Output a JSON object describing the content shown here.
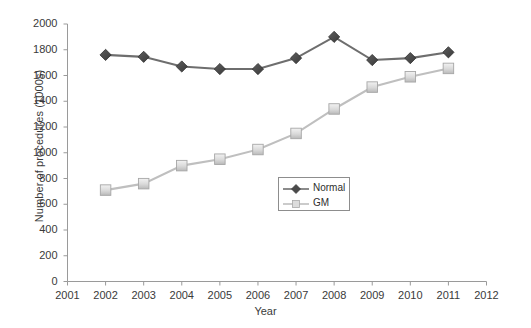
{
  "chart_data": {
    "type": "line",
    "title": "",
    "xlabel": "Year",
    "ylabel": "Number of procedures (1000s)",
    "xlim": [
      2001,
      2012
    ],
    "ylim": [
      0,
      2000
    ],
    "grid": false,
    "legend_position": "center",
    "x": [
      2002,
      2003,
      2004,
      2005,
      2006,
      2007,
      2008,
      2009,
      2010,
      2011
    ],
    "xticks": [
      "2001",
      "2002",
      "2003",
      "2004",
      "2005",
      "2006",
      "2007",
      "2008",
      "2009",
      "2010",
      "2011",
      "2012"
    ],
    "yticks": [
      "0",
      "200",
      "400",
      "600",
      "800",
      "1000",
      "1200",
      "1400",
      "1600",
      "1800",
      "2000"
    ],
    "series": [
      {
        "name": "Normal",
        "marker": "diamond",
        "color": "#4a4a4a",
        "line_color": "#6e6e6e",
        "values": [
          1760,
          1745,
          1670,
          1650,
          1650,
          1735,
          1900,
          1720,
          1735,
          1780
        ]
      },
      {
        "name": "GM",
        "marker": "square",
        "color": "#d4d4d4",
        "line_color": "#bfbfbf",
        "values": [
          710,
          760,
          900,
          950,
          1025,
          1150,
          1340,
          1510,
          1590,
          1655
        ]
      }
    ]
  },
  "legend": {
    "entries": [
      {
        "label": "Normal"
      },
      {
        "label": "GM"
      }
    ]
  }
}
